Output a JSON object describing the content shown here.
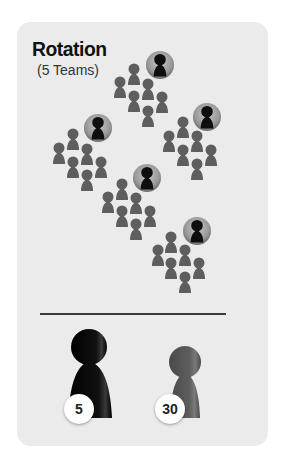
{
  "title": "Rotation",
  "subtitle": "(5 Teams)",
  "colors": {
    "card": "#ebebeb",
    "leader": "#0e0e0e",
    "member": "#5e5e5e",
    "leader_disc": "#9a9a9a",
    "divider": "#3a3a3a"
  },
  "teams": [
    {
      "name": "team-top",
      "leader": [
        160,
        65
      ],
      "members": [
        [
          134,
          75
        ],
        [
          120,
          88
        ],
        [
          148,
          90
        ],
        [
          134,
          102
        ],
        [
          162,
          103
        ],
        [
          148,
          117
        ]
      ]
    },
    {
      "name": "team-left",
      "leader": [
        98,
        128
      ],
      "members": [
        [
          73,
          140
        ],
        [
          59,
          154
        ],
        [
          87,
          155
        ],
        [
          73,
          168
        ],
        [
          101,
          168
        ],
        [
          87,
          181
        ]
      ]
    },
    {
      "name": "team-right",
      "leader": [
        207,
        117
      ],
      "members": [
        [
          183,
          128
        ],
        [
          169,
          142
        ],
        [
          197,
          142
        ],
        [
          183,
          156
        ],
        [
          211,
          156
        ],
        [
          197,
          170
        ]
      ]
    },
    {
      "name": "team-center",
      "leader": [
        147,
        178
      ],
      "members": [
        [
          122,
          190
        ],
        [
          108,
          203
        ],
        [
          136,
          204
        ],
        [
          122,
          217
        ],
        [
          150,
          217
        ],
        [
          136,
          230
        ]
      ]
    },
    {
      "name": "team-bottom",
      "leader": [
        197,
        231
      ],
      "members": [
        [
          171,
          243
        ],
        [
          158,
          256
        ],
        [
          185,
          256
        ],
        [
          171,
          269
        ],
        [
          199,
          269
        ],
        [
          185,
          283
        ]
      ]
    }
  ],
  "legend": {
    "leaders": {
      "label": "5",
      "icon": "black-pawn-icon"
    },
    "members": {
      "label": "30",
      "icon": "gray-pawn-icon"
    }
  }
}
